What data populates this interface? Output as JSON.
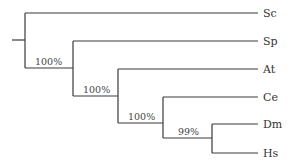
{
  "diagram": {
    "type": "phylogenetic-tree",
    "taxa": [
      {
        "label": "Sc",
        "y": 13
      },
      {
        "label": "Sp",
        "y": 41
      },
      {
        "label": "At",
        "y": 69
      },
      {
        "label": "Ce",
        "y": 97
      },
      {
        "label": "Dm",
        "y": 125
      },
      {
        "label": "Hs",
        "y": 153
      }
    ],
    "support_values": [
      {
        "label": "100%",
        "node": "Sp+At+Ce+Dm+Hs"
      },
      {
        "label": "100%",
        "node": "At+Ce+Dm+Hs"
      },
      {
        "label": "100%",
        "node": "Ce+Dm+Hs"
      },
      {
        "label": "99%",
        "node": "Dm+Hs"
      }
    ],
    "newick": "(Sc,(Sp,(At,(Ce,(Dm,Hs)99%)100%)100%)100%);",
    "colors": {
      "line": "#3a3a3a",
      "text": "#333333"
    }
  }
}
